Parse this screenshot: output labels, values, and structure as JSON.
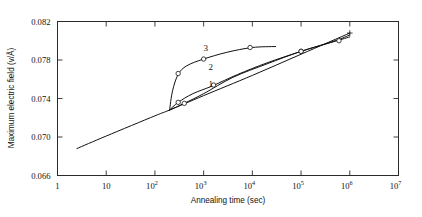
{
  "chart_data": {
    "type": "line",
    "title": "",
    "xlabel": "Annealing time (sec)",
    "ylabel": "Maximum electric field (v/Å)",
    "xscale": "log",
    "yscale": "linear",
    "xlim": [
      1,
      10000000
    ],
    "ylim": [
      0.066,
      0.082
    ],
    "grid": false,
    "legend": "inline-curve-numbers",
    "xticks": [
      {
        "value": 1,
        "label": "1",
        "mantissa": "1",
        "exponent": ""
      },
      {
        "value": 10,
        "label": "10",
        "mantissa": "10",
        "exponent": ""
      },
      {
        "value": 100,
        "label": "10^2",
        "mantissa": "10",
        "exponent": "2"
      },
      {
        "value": 1000,
        "label": "10^3",
        "mantissa": "10",
        "exponent": "3"
      },
      {
        "value": 10000,
        "label": "10^4",
        "mantissa": "10",
        "exponent": "4"
      },
      {
        "value": 100000,
        "label": "10^5",
        "mantissa": "10",
        "exponent": "5"
      },
      {
        "value": 1000000,
        "label": "10^6",
        "mantissa": "10",
        "exponent": "6"
      },
      {
        "value": 10000000,
        "label": "10^7",
        "mantissa": "10",
        "exponent": "7"
      }
    ],
    "yticks": [
      {
        "value": 0.066,
        "label": "0.066"
      },
      {
        "value": 0.07,
        "label": "0.070"
      },
      {
        "value": 0.074,
        "label": "0.074"
      },
      {
        "value": 0.078,
        "label": "0.078"
      },
      {
        "value": 0.082,
        "label": "0.082"
      }
    ],
    "series": [
      {
        "name": "baseline",
        "label": "",
        "marker": "plus-at-end",
        "points": [
          {
            "x": 2.5,
            "y": 0.0688
          },
          {
            "x": 10,
            "y": 0.0701
          },
          {
            "x": 100,
            "y": 0.0722
          },
          {
            "x": 200,
            "y": 0.0728
          },
          {
            "x": 1000,
            "y": 0.0743
          },
          {
            "x": 10000,
            "y": 0.0764
          },
          {
            "x": 100000,
            "y": 0.0786
          },
          {
            "x": 1000000,
            "y": 0.0808
          }
        ]
      },
      {
        "name": "curve-1",
        "label": "1",
        "marker": "open-circle",
        "points": [
          {
            "x": 200,
            "y": 0.0728
          },
          {
            "x": 400,
            "y": 0.0735
          },
          {
            "x": 1000,
            "y": 0.0745
          },
          {
            "x": 4000,
            "y": 0.0762
          },
          {
            "x": 20000,
            "y": 0.0776
          },
          {
            "x": 100000,
            "y": 0.0789
          },
          {
            "x": 400000,
            "y": 0.0798
          },
          {
            "x": 1000000,
            "y": 0.0804
          }
        ],
        "data_markers": [
          {
            "x": 400,
            "y": 0.0735
          },
          {
            "x": 100000,
            "y": 0.0789
          },
          {
            "x": 600000,
            "y": 0.08
          }
        ]
      },
      {
        "name": "curve-2",
        "label": "2",
        "marker": "open-circle",
        "points": [
          {
            "x": 200,
            "y": 0.0728
          },
          {
            "x": 300,
            "y": 0.0736
          },
          {
            "x": 600,
            "y": 0.0745
          },
          {
            "x": 1500,
            "y": 0.0753
          },
          {
            "x": 5000,
            "y": 0.0765
          },
          {
            "x": 20000,
            "y": 0.0777
          },
          {
            "x": 100000,
            "y": 0.0789
          },
          {
            "x": 500000,
            "y": 0.08
          },
          {
            "x": 1000000,
            "y": 0.0806
          }
        ],
        "data_markers": [
          {
            "x": 300,
            "y": 0.0736
          },
          {
            "x": 1600,
            "y": 0.0754
          },
          {
            "x": 100000,
            "y": 0.0789
          }
        ]
      },
      {
        "name": "curve-3",
        "label": "3",
        "marker": "open-circle",
        "points": [
          {
            "x": 200,
            "y": 0.0728
          },
          {
            "x": 230,
            "y": 0.0748
          },
          {
            "x": 300,
            "y": 0.0765
          },
          {
            "x": 450,
            "y": 0.0774
          },
          {
            "x": 1000,
            "y": 0.0781
          },
          {
            "x": 3000,
            "y": 0.0788
          },
          {
            "x": 10000,
            "y": 0.0793
          },
          {
            "x": 30000,
            "y": 0.0794
          }
        ],
        "data_markers": [
          {
            "x": 300,
            "y": 0.0766
          },
          {
            "x": 1000,
            "y": 0.0781
          },
          {
            "x": 9000,
            "y": 0.0793
          }
        ]
      }
    ],
    "curve_annotations": [
      {
        "label": "1",
        "x": 1400,
        "y": 0.0752
      },
      {
        "label": "2",
        "x": 1400,
        "y": 0.077
      },
      {
        "label": "3",
        "x": 1100,
        "y": 0.0789
      }
    ]
  }
}
